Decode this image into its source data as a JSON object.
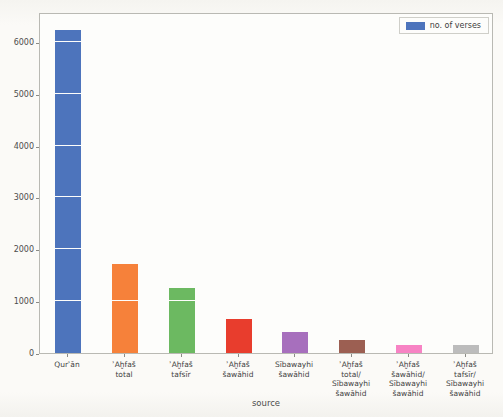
{
  "legend": {
    "label": "no. of verses",
    "swatch_color": "#4d74bc",
    "position": "upper right"
  },
  "chart_data": {
    "type": "bar",
    "title": "",
    "xlabel": "source",
    "ylabel": "",
    "ylim": [
      0,
      6575
    ],
    "y_ticks": [
      0,
      1000,
      2000,
      3000,
      4000,
      5000,
      6000
    ],
    "grid": "white horizontal gridlines at each 1000, visible only over bars",
    "legend_entries": [
      "no. of verses"
    ],
    "categories": [
      "Qurʾān",
      "ʾAḫfaš total",
      "ʾAḫfaš tafsīr",
      "ʾAḫfaš šawāhid",
      "Sībawayhi šawāhid",
      "ʾAḫfaš total/ Sībawayhi šawāhid",
      "ʾAḫfaš šawāhid/ Sībawayhi šawāhid",
      "ʾAḫfaš tafsīr/ Sībawayhi šawāhid"
    ],
    "tick_label_lines": [
      "Qurʾān",
      "ʾAḫfaš\ntotal",
      "ʾAḫfaš\ntafsīr",
      "ʾAḫfaš\nšawāhid",
      "Sībawayhi\nšawāhid",
      "ʾAḫfaš\ntotal/\nSībawayhi\nšawāhid",
      "ʾAḫfaš\nšawāhid/\nSībawayhi\nšawāhid",
      "ʾAḫfaš\ntafsīr/\nSībawayhi\nšawāhid"
    ],
    "values": [
      6236,
      1710,
      1250,
      650,
      400,
      250,
      150,
      150
    ],
    "bar_colors": [
      "#4d74bc",
      "#f6813a",
      "#6cb961",
      "#e83d2d",
      "#a76fbd",
      "#9c5f52",
      "#f783c4",
      "#bcbcbc"
    ]
  }
}
